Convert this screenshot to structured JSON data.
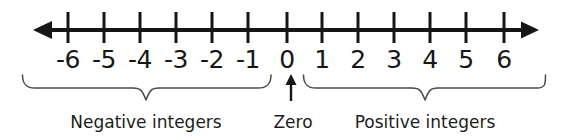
{
  "figure": {
    "background_color": "#ffffff",
    "line_color": "#161616",
    "brace_color": "#4a4a4a"
  },
  "chart_data": {
    "type": "numberline",
    "title": "",
    "xlabel": "",
    "ylabel": "",
    "xlim": [
      -6.9,
      6.9
    ],
    "grid": false,
    "legend": null,
    "tick_values": [
      -6,
      -5,
      -4,
      -3,
      -2,
      -1,
      0,
      1,
      2,
      3,
      4,
      5,
      6
    ],
    "tick_labels": [
      "-6",
      "-5",
      "-4",
      "-3",
      "-2",
      "-1",
      "0",
      "1",
      "2",
      "3",
      "4",
      "5",
      "6"
    ],
    "tick_pixel_x": [
      68,
      104,
      140,
      176,
      212,
      248,
      287,
      322,
      358,
      394,
      430,
      466,
      504
    ],
    "axis_arrows": [
      "left",
      "right"
    ],
    "annotations": [
      {
        "id": "negative-group",
        "label": "Negative integers",
        "covers": [
          -6,
          -1
        ],
        "marker": "brace",
        "center_pixel_x": 146
      },
      {
        "id": "zero-group",
        "label": "Zero",
        "covers": [
          0,
          0
        ],
        "marker": "arrow",
        "center_pixel_x": 291
      },
      {
        "id": "positive-group",
        "label": "Positive integers",
        "covers": [
          1,
          6
        ],
        "marker": "brace",
        "center_pixel_x": 425
      }
    ]
  },
  "ticks": [
    {
      "label": "-6",
      "x": 68
    },
    {
      "label": "-5",
      "x": 104
    },
    {
      "label": "-4",
      "x": 140
    },
    {
      "label": "-3",
      "x": 176
    },
    {
      "label": "-2",
      "x": 212
    },
    {
      "label": "-1",
      "x": 248
    },
    {
      "label": "0",
      "x": 287
    },
    {
      "label": "1",
      "x": 322
    },
    {
      "label": "2",
      "x": 358
    },
    {
      "label": "3",
      "x": 394
    },
    {
      "label": "4",
      "x": 430
    },
    {
      "label": "5",
      "x": 466
    },
    {
      "label": "6",
      "x": 504
    }
  ],
  "captions": {
    "negative": "Negative integers",
    "zero": "Zero",
    "positive": "Positive integers"
  }
}
